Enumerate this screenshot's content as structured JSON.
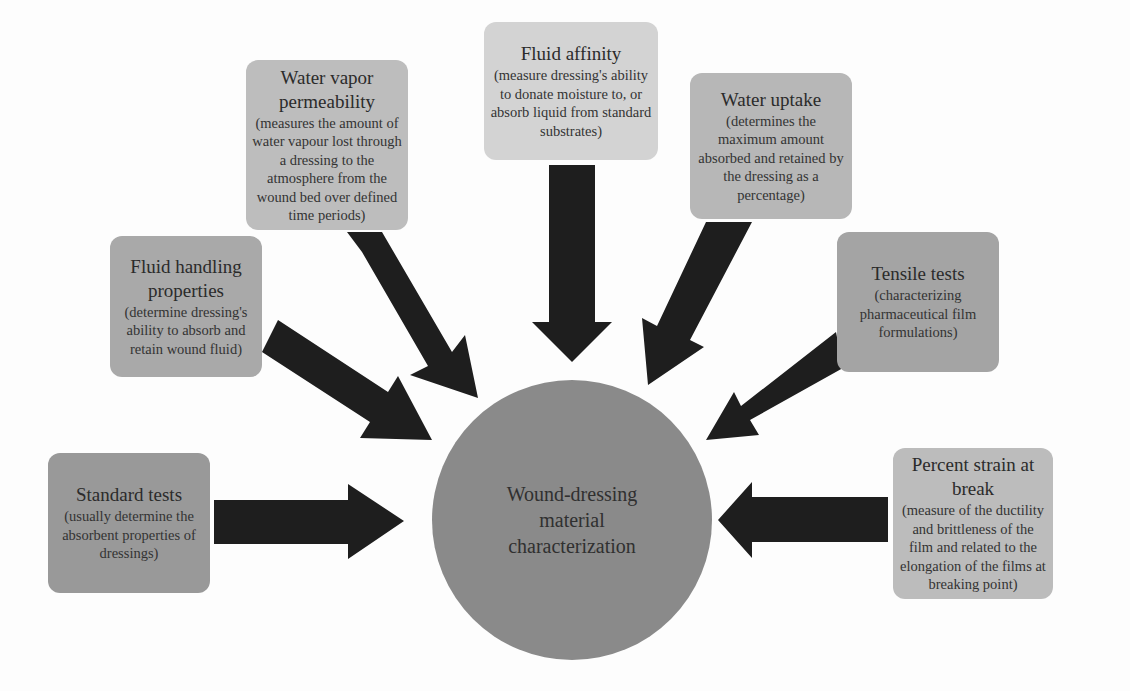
{
  "diagram": {
    "center": {
      "label": "Wound-dressing material characterization",
      "color": "#8a8a8a"
    },
    "arrow_color": "#1e1e1e",
    "nodes": [
      {
        "id": "standard-tests",
        "title": "Standard tests",
        "description": "(usually determine the absorbent properties of dressings)",
        "color": "#999999"
      },
      {
        "id": "fluid-handling",
        "title": "Fluid handling properties",
        "description": "(determine dressing's ability to absorb and retain wound fluid)",
        "color": "#a9a9a9"
      },
      {
        "id": "water-vapor",
        "title": "Water vapor permeability",
        "description": "(measures the amount of water vapour lost through a dressing to the atmosphere from the wound bed over defined time periods)",
        "color": "#bdbdbd"
      },
      {
        "id": "fluid-affinity",
        "title": "Fluid affinity",
        "description": "(measure dressing's ability to donate moisture to, or absorb liquid from standard substrates)",
        "color": "#d3d3d3"
      },
      {
        "id": "water-uptake",
        "title": "Water uptake",
        "description": "(determines the maximum amount absorbed and retained by the dressing as a percentage)",
        "color": "#b7b7b7"
      },
      {
        "id": "tensile-tests",
        "title": "Tensile tests",
        "description": "(characterizing pharmaceutical film formulations)",
        "color": "#a4a4a4"
      },
      {
        "id": "percent-strain",
        "title": "Percent strain at break",
        "description": "(measure of the ductility and brittleness of the film and related to the elongation of the films at breaking point)",
        "color": "#bcbcbc"
      }
    ]
  }
}
